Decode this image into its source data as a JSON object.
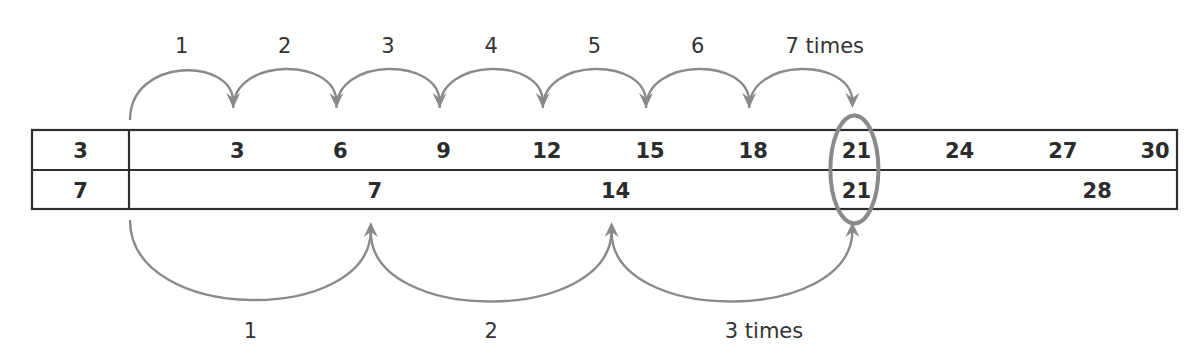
{
  "diagram": {
    "title_fragment": "",
    "colors": {
      "arrow": "#8a8a8a",
      "grid": "#2e2e2e",
      "text": "#2b2b2b",
      "highlight_ring": "#8a8a8a"
    },
    "rows": [
      {
        "name": "multiples-of-3",
        "header": "3",
        "values": [
          "3",
          "6",
          "9",
          "12",
          "15",
          "18",
          "21",
          "24",
          "27",
          "30"
        ]
      },
      {
        "name": "multiples-of-7",
        "header": "7",
        "values": [
          "7",
          "14",
          "21",
          "28"
        ]
      }
    ],
    "top_jumps": {
      "labels": [
        "1",
        "2",
        "3",
        "4",
        "5",
        "6",
        "7 times"
      ],
      "count": 7,
      "step": 3
    },
    "bottom_jumps": {
      "labels": [
        "1",
        "2",
        "3 times"
      ],
      "count": 3,
      "step": 7
    },
    "highlight": {
      "value": "21",
      "meaning": "common multiple"
    }
  }
}
